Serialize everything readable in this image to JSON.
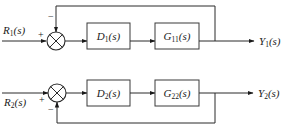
{
  "diagram": {
    "loops": [
      {
        "id": "loop1",
        "input": {
          "name": "R",
          "sub": "1",
          "arg": "(s)"
        },
        "output": {
          "name": "Y",
          "sub": "1",
          "arg": "(s)"
        },
        "controller": {
          "name": "D",
          "sub": "1",
          "arg": "(s)"
        },
        "plant": {
          "name": "G",
          "sub": "11",
          "arg": "(s)"
        },
        "sum_signs": {
          "input": "+",
          "feedback": "−"
        },
        "feedback_position": "above"
      },
      {
        "id": "loop2",
        "input": {
          "name": "R",
          "sub": "2",
          "arg": "(s)"
        },
        "output": {
          "name": "Y",
          "sub": "2",
          "arg": "(s)"
        },
        "controller": {
          "name": "D",
          "sub": "2",
          "arg": "(s)"
        },
        "plant": {
          "name": "G",
          "sub": "22",
          "arg": "(s)"
        },
        "sum_signs": {
          "input": "+",
          "feedback": "−"
        },
        "feedback_position": "below"
      }
    ],
    "colors": {
      "line": "#2a2a2a",
      "background": "#ffffff"
    }
  }
}
